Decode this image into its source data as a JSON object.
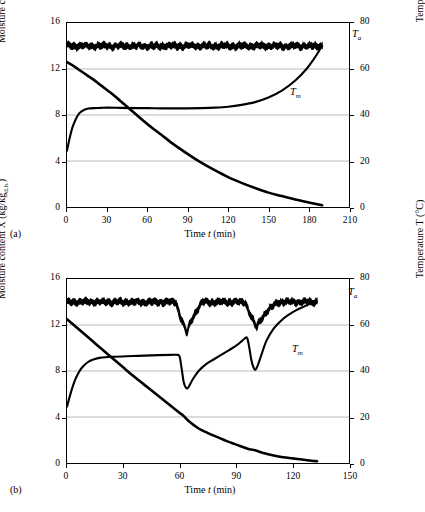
{
  "figure": {
    "background": "#ffffff",
    "line_color": "#000000",
    "grid_color": "#b9b9b9"
  },
  "panels": [
    {
      "caption": "(a)",
      "chart_data": {
        "type": "line",
        "title": "",
        "xlabel": "Time t (min)",
        "ylabel": "Moisture content X (kg/kg",
        "ylabel_sub": "d.b.",
        "ylabel_tail": ")",
        "y2label": "Temperature T (°C)",
        "xlim": [
          0,
          210
        ],
        "ylim": [
          0,
          16
        ],
        "y2lim": [
          0,
          80
        ],
        "xticks": [
          0,
          30,
          60,
          90,
          120,
          150,
          180,
          210
        ],
        "yticks": [
          0,
          4,
          8,
          12,
          16
        ],
        "y2ticks": [
          0,
          20,
          40,
          60,
          80
        ],
        "grid": true,
        "legend_position": "inline-annotation",
        "series": [
          {
            "name": "Moisture content X",
            "axis": "left",
            "x": [
              0,
              5,
              10,
              15,
              20,
              25,
              30,
              35,
              40,
              45,
              50,
              60,
              70,
              80,
              90,
              100,
              110,
              120,
              130,
              140,
              150,
              160,
              170,
              180,
              190
            ],
            "values": [
              12.6,
              12.25,
              11.85,
              11.45,
              11.05,
              10.6,
              10.15,
              9.7,
              9.2,
              8.7,
              8.2,
              7.2,
              6.3,
              5.4,
              4.6,
              3.85,
              3.2,
              2.6,
              2.1,
              1.65,
              1.25,
              0.95,
              0.65,
              0.4,
              0.15
            ]
          },
          {
            "name": "T_a",
            "label": "T",
            "label_sub": "a",
            "axis": "right",
            "description": "Drying air temperature, noisy band oscillating about 70 °C",
            "mean": 70,
            "noise_amplitude": 1.6,
            "x_start": 0,
            "x_end": 190
          },
          {
            "name": "T_m",
            "label": "T",
            "label_sub": "m",
            "axis": "right",
            "x": [
              0,
              2,
              4,
              6,
              8,
              10,
              13,
              16,
              20,
              25,
              30,
              40,
              50,
              60,
              70,
              80,
              90,
              100,
              110,
              120,
              130,
              140,
              150,
              160,
              170,
              178,
              184,
              188,
              190
            ],
            "values": [
              24.5,
              30,
              34.5,
              37.5,
              39.8,
              41.2,
              42.3,
              42.8,
              43.0,
              43.1,
              43.2,
              43.1,
              43.0,
              43.0,
              42.9,
              42.9,
              42.9,
              43.0,
              43.2,
              43.6,
              44.4,
              45.6,
              47.6,
              50.6,
              55.0,
              59.8,
              64.5,
              68.2,
              70.0
            ]
          }
        ],
        "annotations": [
          {
            "text": "T",
            "sub": "a",
            "x": 195,
            "y_right": 74
          },
          {
            "text": "T",
            "sub": "m",
            "x": 152,
            "y_right": 52
          }
        ]
      }
    },
    {
      "caption": "(b)",
      "chart_data": {
        "type": "line",
        "title": "",
        "xlabel": "Time t (min)",
        "ylabel": "Moisture content X (kg/kg",
        "ylabel_sub": "d.b.",
        "ylabel_tail": ")",
        "y2label": "Temperature T (°C)",
        "xlim": [
          0,
          150
        ],
        "ylim": [
          0,
          16
        ],
        "y2lim": [
          0,
          80
        ],
        "xticks": [
          0,
          30,
          60,
          90,
          120,
          150
        ],
        "yticks": [
          0,
          4,
          8,
          12,
          16
        ],
        "y2ticks": [
          0,
          20,
          40,
          60,
          80
        ],
        "grid": true,
        "legend_position": "inline-annotation",
        "series": [
          {
            "name": "Moisture content X",
            "axis": "left",
            "x": [
              0,
              5,
              10,
              15,
              20,
              25,
              30,
              35,
              40,
              45,
              50,
              55,
              60,
              62,
              65,
              70,
              75,
              80,
              85,
              90,
              95,
              97,
              100,
              105,
              110,
              115,
              120,
              125,
              130,
              133
            ],
            "values": [
              12.5,
              11.8,
              11.1,
              10.4,
              9.7,
              9.0,
              8.3,
              7.6,
              6.95,
              6.3,
              5.65,
              5.0,
              4.35,
              4.1,
              3.6,
              3.0,
              2.6,
              2.25,
              1.9,
              1.6,
              1.3,
              1.2,
              1.1,
              0.85,
              0.65,
              0.5,
              0.4,
              0.3,
              0.2,
              0.15
            ]
          },
          {
            "name": "T_a",
            "label": "T",
            "label_sub": "a",
            "axis": "right",
            "description": "Drying air temperature, noisy band about 70 °C with two tempering dips",
            "mean": 70,
            "noise_amplitude": 1.6,
            "dips": [
              {
                "start": 58,
                "min_x": 64,
                "min_value": 56,
                "recover_x": 72
              },
              {
                "start": 95,
                "min_x": 101,
                "min_value": 58.5,
                "recover_x": 112
              }
            ],
            "x_start": 0,
            "x_end": 133
          },
          {
            "name": "T_m",
            "label": "T",
            "label_sub": "m",
            "axis": "right",
            "x": [
              0,
              2,
              4,
              6,
              8,
              11,
              14,
              18,
              25,
              35,
              45,
              55,
              59,
              60,
              61,
              62,
              63,
              64,
              65,
              67,
              70,
              74,
              78,
              82,
              86,
              90,
              93,
              95,
              96,
              97,
              98,
              99,
              100,
              101,
              103,
              106,
              110,
              114,
              118,
              122,
              126,
              130,
              133
            ],
            "values": [
              24.5,
              30.5,
              35.5,
              39.0,
              41.5,
              43.8,
              45.0,
              45.8,
              46.2,
              46.5,
              46.8,
              47.0,
              47.0,
              46.0,
              41.0,
              35.5,
              33.0,
              32.4,
              33.5,
              36.5,
              40.0,
              43.0,
              45.0,
              47.0,
              49.0,
              51.0,
              53.0,
              54.5,
              54.0,
              50.0,
              45.0,
              42.0,
              40.5,
              41.5,
              46.0,
              53.0,
              58.5,
              62.0,
              64.5,
              66.5,
              68.0,
              69.5,
              70.2
            ]
          }
        ],
        "annotations": [
          {
            "text": "T",
            "sub": "a",
            "x": 140,
            "y_right": 74
          },
          {
            "text": "T",
            "sub": "m",
            "x": 116,
            "y_right": 52
          }
        ]
      }
    }
  ]
}
